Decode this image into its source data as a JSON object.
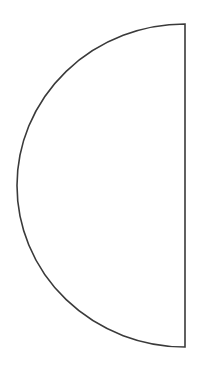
{
  "figure": {
    "shape": "half-circle",
    "orientation": "left",
    "stroke_color": "#3a3a3a",
    "fill_color": "#ffffff",
    "background_color": "#ffffff",
    "stroke_width": 1.6,
    "geometry": {
      "center_x": 185,
      "center_y": 185.5,
      "radius_x": 168,
      "radius_y": 161.5,
      "top": 24,
      "bottom": 347,
      "left": 17,
      "right": 185
    }
  }
}
